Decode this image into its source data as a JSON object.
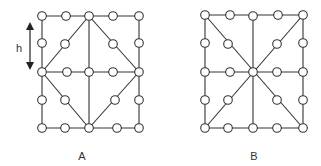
{
  "colors": {
    "line": "#333333",
    "node_fill": "#ffffff",
    "background": "#ffffff"
  },
  "dimension_label": "h",
  "diagrams": [
    {
      "label": "A",
      "label_pos": [
        82,
        160
      ],
      "nodes": [
        [
          42,
          16
        ],
        [
          66,
          16
        ],
        [
          89,
          16
        ],
        [
          113,
          16
        ],
        [
          139,
          16
        ],
        [
          42,
          43
        ],
        [
          65,
          44
        ],
        [
          113,
          44
        ],
        [
          139,
          43
        ],
        [
          42,
          72
        ],
        [
          67,
          72
        ],
        [
          89,
          72
        ],
        [
          113,
          72
        ],
        [
          139,
          72
        ],
        [
          42,
          100
        ],
        [
          65,
          100
        ],
        [
          115,
          100
        ],
        [
          139,
          100
        ],
        [
          42,
          128
        ],
        [
          65,
          128
        ],
        [
          89,
          128
        ],
        [
          117,
          128
        ],
        [
          139,
          128
        ]
      ],
      "edges": [
        [
          42,
          16,
          139,
          16
        ],
        [
          139,
          16,
          139,
          128
        ],
        [
          139,
          128,
          42,
          128
        ],
        [
          42,
          128,
          42,
          16
        ],
        [
          42,
          72,
          139,
          72
        ],
        [
          89,
          16,
          89,
          128
        ],
        [
          89,
          16,
          42,
          72
        ],
        [
          89,
          16,
          139,
          72
        ],
        [
          42,
          72,
          89,
          128
        ],
        [
          139,
          72,
          89,
          128
        ]
      ]
    },
    {
      "label": "B",
      "label_pos": [
        254,
        160
      ],
      "nodes": [
        [
          205,
          15
        ],
        [
          230,
          15
        ],
        [
          253,
          16
        ],
        [
          278,
          15
        ],
        [
          303,
          15
        ],
        [
          205,
          43
        ],
        [
          228,
          44
        ],
        [
          277,
          44
        ],
        [
          303,
          43
        ],
        [
          205,
          72
        ],
        [
          230,
          72
        ],
        [
          253,
          72
        ],
        [
          277,
          72
        ],
        [
          303,
          72
        ],
        [
          205,
          100
        ],
        [
          228,
          100
        ],
        [
          277,
          100
        ],
        [
          303,
          100
        ],
        [
          205,
          128
        ],
        [
          228,
          128
        ],
        [
          253,
          128
        ],
        [
          277,
          128
        ],
        [
          303,
          128
        ]
      ],
      "edges": [
        [
          205,
          15,
          303,
          15
        ],
        [
          303,
          15,
          303,
          128
        ],
        [
          303,
          128,
          205,
          128
        ],
        [
          205,
          128,
          205,
          15
        ],
        [
          205,
          72,
          303,
          72
        ],
        [
          253,
          16,
          253,
          128
        ],
        [
          205,
          15,
          303,
          128
        ],
        [
          303,
          15,
          205,
          128
        ]
      ]
    }
  ],
  "arrow": {
    "x": 30,
    "y1": 22,
    "y2": 70,
    "label_pos": [
      19,
      52
    ]
  }
}
